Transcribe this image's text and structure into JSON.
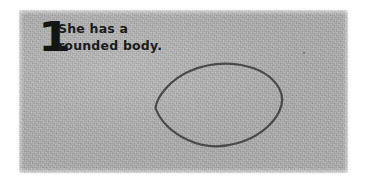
{
  "panel": {
    "background_color": "#b2b2b2",
    "texture": "paper-grain"
  },
  "step": {
    "number": "1",
    "caption_lines": [
      "She has a",
      "rounded body."
    ],
    "text_color": "#1b1b1b",
    "number_color": "#141414"
  },
  "drawing": {
    "shape_name": "rounded-body-outline",
    "description": "hand-drawn lemon-shaped oval with pointed left and right tips",
    "stroke_color": "#4a4a4a",
    "stroke_width": 2.2,
    "fill": "none",
    "bounds": {
      "x": 155,
      "y": 63,
      "width": 128,
      "height": 84
    },
    "tips": {
      "left": [
        155,
        108
      ],
      "right": [
        283,
        101
      ]
    }
  },
  "artifact": {
    "speck_color": "#464646"
  }
}
